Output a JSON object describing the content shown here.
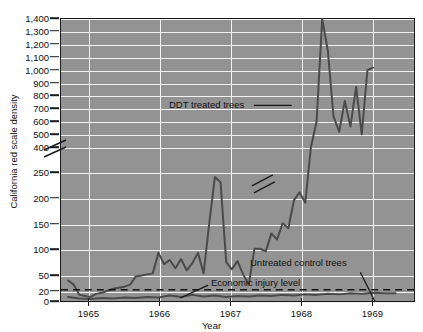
{
  "chart_data": {
    "type": "line",
    "title": "",
    "xlabel": "Year",
    "ylabel": "California red scale density",
    "grid": true,
    "legend": "annotations",
    "axis_break": {
      "axis": "y",
      "lower_max": 250,
      "upper_min": 400,
      "note": "broken y-axis between 250 and 400"
    },
    "yticks_upper": [
      "400",
      "500",
      "600",
      "700",
      "800",
      "900",
      "1,000",
      "1,100",
      "1,200",
      "1,300",
      "1,400"
    ],
    "yticks_lower": [
      "0",
      "20",
      "50",
      "100",
      "150",
      "200",
      "250"
    ],
    "ylim_lower": [
      0,
      250
    ],
    "ylim_upper": [
      400,
      1400
    ],
    "xticks": [
      "1965",
      "1966",
      "1967",
      "1968",
      "1969"
    ],
    "xlim": [
      "1964.6",
      "1969.6"
    ],
    "annotations": [
      {
        "name": "ddt-annotation",
        "text": "DDT treated trees"
      },
      {
        "name": "control-annotation",
        "text": "Untreated control trees"
      },
      {
        "name": "injury-annotation",
        "text": "Economic injury level"
      }
    ],
    "threshold": {
      "label": "Economic injury level",
      "value": 20,
      "style": "dashed"
    },
    "series": [
      {
        "name": "DDT treated trees",
        "color": "#4a4a4a",
        "x": [
          1964.7,
          1964.78,
          1964.86,
          1964.94,
          1965.02,
          1965.1,
          1965.18,
          1965.26,
          1965.34,
          1965.42,
          1965.5,
          1965.58,
          1965.66,
          1965.74,
          1965.82,
          1965.9,
          1965.98,
          1966.06,
          1966.14,
          1966.22,
          1966.3,
          1966.38,
          1966.46,
          1966.54,
          1966.62,
          1966.7,
          1966.78,
          1966.86,
          1966.94,
          1967.02,
          1967.1,
          1967.18,
          1967.26,
          1967.34,
          1967.42,
          1967.5,
          1967.58,
          1967.66,
          1967.74,
          1967.82,
          1967.9,
          1967.98,
          1968.06,
          1968.14,
          1968.22,
          1968.3,
          1968.38,
          1968.46,
          1968.54,
          1968.62,
          1968.7,
          1968.78,
          1968.86,
          1968.94,
          1969.02
        ],
        "y": [
          38,
          30,
          10,
          8,
          6,
          12,
          14,
          18,
          22,
          24,
          26,
          30,
          46,
          48,
          50,
          52,
          92,
          70,
          78,
          62,
          80,
          58,
          72,
          92,
          52,
          150,
          240,
          230,
          74,
          60,
          76,
          50,
          30,
          100,
          100,
          95,
          130,
          118,
          150,
          140,
          195,
          210,
          190,
          255,
          600,
          1400,
          1150,
          640,
          520,
          760,
          560,
          870,
          500,
          1000,
          1020
        ]
      },
      {
        "name": "Untreated control trees",
        "color": "#4a4a4a",
        "x": [
          1964.7,
          1964.86,
          1965.02,
          1965.18,
          1965.34,
          1965.5,
          1965.66,
          1965.82,
          1965.98,
          1966.14,
          1966.3,
          1966.46,
          1966.62,
          1966.78,
          1966.94,
          1967.1,
          1967.26,
          1967.42,
          1967.58,
          1967.74,
          1967.9,
          1968.06,
          1968.22,
          1968.38,
          1968.54,
          1968.7,
          1968.86,
          1969.02,
          1969.18,
          1969.34
        ],
        "y": [
          6,
          3,
          2,
          4,
          3,
          5,
          4,
          6,
          5,
          9,
          6,
          10,
          7,
          9,
          6,
          8,
          7,
          9,
          8,
          10,
          9,
          11,
          10,
          12,
          11,
          13,
          12,
          14,
          13,
          13
        ]
      }
    ]
  }
}
